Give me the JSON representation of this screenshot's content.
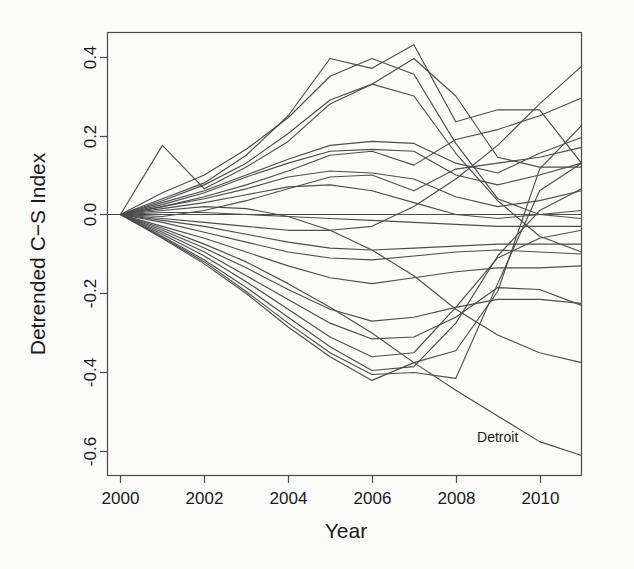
{
  "figure": {
    "background_color": "#fbfbfa",
    "line_color": "#4d4d4d",
    "axis_color": "#4a4a4a",
    "text_color": "#1a1a1a"
  },
  "axes": {
    "x_title": "Year",
    "y_title": "Detrended C−S Index",
    "x_ticks": [
      "2000",
      "2002",
      "2004",
      "2006",
      "2008",
      "2010"
    ],
    "y_ticks": [
      "0.4",
      "0.2",
      "0.0",
      "-0.2",
      "-0.4",
      "-0.6"
    ]
  },
  "annotations": [
    {
      "name": "detroit-label",
      "text": "Detroit",
      "x": 2009.0,
      "y": -0.575
    }
  ],
  "chart_data": {
    "type": "line",
    "title": "",
    "xlabel": "Year",
    "ylabel": "Detrended C−S Index",
    "xlim": [
      2000,
      2011
    ],
    "ylim": [
      -0.66,
      0.48
    ],
    "x_ticks": [
      2000,
      2002,
      2004,
      2006,
      2008,
      2010
    ],
    "y_ticks": [
      0.4,
      0.2,
      0.0,
      -0.2,
      -0.4,
      -0.6
    ],
    "grid": false,
    "legend": "none",
    "reference_lines": [
      {
        "axis": "y",
        "value": 0.0
      }
    ],
    "x": [
      2000,
      2001,
      2002,
      2003,
      2004,
      2005,
      2006,
      2007,
      2008,
      2009,
      2010,
      2011
    ],
    "series": [
      {
        "name": "Series-01",
        "values": [
          0.0,
          0.175,
          0.065,
          0.12,
          0.185,
          0.28,
          0.33,
          0.3,
          0.155,
          0.035,
          -0.055,
          -0.095
        ]
      },
      {
        "name": "Series-02",
        "values": [
          0.0,
          0.055,
          0.1,
          0.165,
          0.245,
          0.35,
          0.395,
          0.355,
          0.18,
          0.04,
          0.0,
          -0.01
        ]
      },
      {
        "name": "Series-03",
        "values": [
          0.0,
          0.04,
          0.08,
          0.15,
          0.25,
          0.395,
          0.37,
          0.43,
          0.235,
          0.265,
          0.265,
          0.13
        ]
      },
      {
        "name": "Series-04",
        "values": [
          0.0,
          0.035,
          0.075,
          0.13,
          0.205,
          0.29,
          0.33,
          0.395,
          0.3,
          0.145,
          0.12,
          0.12
        ]
      },
      {
        "name": "Series-05",
        "values": [
          0.0,
          0.03,
          0.06,
          0.1,
          0.14,
          0.175,
          0.185,
          0.18,
          0.13,
          0.105,
          0.155,
          0.195
        ]
      },
      {
        "name": "Series-06",
        "values": [
          0.0,
          0.025,
          0.055,
          0.095,
          0.13,
          0.16,
          0.165,
          0.16,
          0.1,
          0.075,
          0.1,
          0.13
        ]
      },
      {
        "name": "Series-07",
        "values": [
          0.0,
          0.02,
          0.04,
          0.065,
          0.095,
          0.11,
          0.105,
          0.09,
          0.045,
          0.02,
          0.035,
          0.06
        ]
      },
      {
        "name": "Series-08",
        "values": [
          0.0,
          0.015,
          0.03,
          0.05,
          0.07,
          0.075,
          0.06,
          0.03,
          0.0,
          -0.01,
          0.0,
          0.01
        ]
      },
      {
        "name": "Series-09",
        "values": [
          0.0,
          0.005,
          0.005,
          0.0,
          -0.005,
          -0.01,
          -0.015,
          -0.02,
          -0.025,
          -0.03,
          -0.03,
          -0.03
        ]
      },
      {
        "name": "Series-10",
        "values": [
          0.0,
          -0.015,
          -0.03,
          -0.05,
          -0.07,
          -0.085,
          -0.09,
          -0.085,
          -0.08,
          -0.075,
          -0.075,
          -0.075
        ]
      },
      {
        "name": "Series-11",
        "values": [
          0.0,
          -0.02,
          -0.045,
          -0.07,
          -0.095,
          -0.11,
          -0.115,
          -0.105,
          -0.095,
          -0.09,
          -0.095,
          -0.1
        ]
      },
      {
        "name": "Series-12",
        "values": [
          0.0,
          -0.03,
          -0.06,
          -0.095,
          -0.13,
          -0.16,
          -0.175,
          -0.16,
          -0.145,
          -0.135,
          -0.135,
          -0.13
        ]
      },
      {
        "name": "Series-13",
        "values": [
          0.0,
          -0.04,
          -0.085,
          -0.135,
          -0.19,
          -0.24,
          -0.27,
          -0.26,
          -0.235,
          -0.215,
          -0.215,
          -0.225
        ]
      },
      {
        "name": "Series-14",
        "values": [
          0.0,
          -0.045,
          -0.095,
          -0.155,
          -0.215,
          -0.275,
          -0.315,
          -0.31,
          -0.26,
          -0.185,
          -0.19,
          -0.23
        ]
      },
      {
        "name": "Series-15",
        "values": [
          0.0,
          -0.05,
          -0.105,
          -0.17,
          -0.24,
          -0.31,
          -0.36,
          -0.35,
          -0.235,
          -0.11,
          -0.06,
          -0.04
        ]
      },
      {
        "name": "Series-16",
        "values": [
          0.0,
          -0.055,
          -0.115,
          -0.185,
          -0.26,
          -0.335,
          -0.395,
          -0.385,
          -0.275,
          -0.105,
          0.01,
          0.065
        ]
      },
      {
        "name": "Series-17",
        "values": [
          0.0,
          -0.058,
          -0.12,
          -0.195,
          -0.275,
          -0.35,
          -0.405,
          -0.4,
          -0.415,
          -0.175,
          0.06,
          0.13
        ]
      },
      {
        "name": "Series-18",
        "values": [
          0.0,
          -0.06,
          -0.125,
          -0.2,
          -0.285,
          -0.36,
          -0.42,
          -0.375,
          -0.345,
          -0.195,
          0.115,
          0.225
        ]
      },
      {
        "name": "Series-19",
        "values": [
          0.0,
          0.01,
          0.02,
          0.015,
          -0.005,
          -0.04,
          -0.09,
          -0.155,
          -0.24,
          -0.305,
          -0.35,
          -0.375
        ]
      },
      {
        "name": "Series-20",
        "values": [
          0.0,
          -0.01,
          -0.02,
          -0.03,
          -0.04,
          -0.04,
          -0.03,
          0.02,
          0.09,
          0.175,
          0.28,
          0.375
        ]
      },
      {
        "name": "Series-21",
        "values": [
          0.0,
          0.02,
          0.045,
          0.075,
          0.11,
          0.15,
          0.16,
          0.125,
          0.19,
          0.215,
          0.25,
          0.295
        ]
      },
      {
        "name": "Series-22",
        "values": [
          0.0,
          -0.005,
          0.01,
          0.035,
          0.065,
          0.095,
          0.1,
          0.06,
          0.115,
          0.13,
          0.145,
          0.17
        ]
      },
      {
        "name": "Detroit",
        "values": [
          0.0,
          -0.035,
          -0.075,
          -0.12,
          -0.175,
          -0.235,
          -0.3,
          -0.375,
          -0.445,
          -0.51,
          -0.575,
          -0.61
        ]
      }
    ]
  }
}
